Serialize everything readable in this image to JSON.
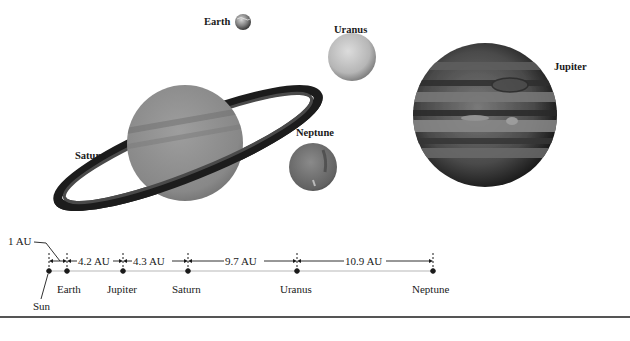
{
  "figure": {
    "planet_labels": {
      "earth": "Earth",
      "uranus": "Uranus",
      "jupiter": "Jupiter",
      "saturn": "Saturn",
      "neptune": "Neptune"
    },
    "scale": {
      "unit_note": "1 AU",
      "segments": [
        {
          "from": "Sun",
          "to": "Earth",
          "label": "1 AU"
        },
        {
          "from": "Earth",
          "to": "Jupiter",
          "label": "4.2 AU"
        },
        {
          "from": "Jupiter",
          "to": "Saturn",
          "label": "4.3 AU"
        },
        {
          "from": "Saturn",
          "to": "Uranus",
          "label": "9.7 AU"
        },
        {
          "from": "Uranus",
          "to": "Neptune",
          "label": "10.9 AU"
        }
      ],
      "bodies": [
        "Sun",
        "Earth",
        "Jupiter",
        "Saturn",
        "Uranus",
        "Neptune"
      ]
    },
    "colors": {
      "ink": "#1a1a1a",
      "rule": "#555555",
      "jupiter_dark": "#2a2a2a",
      "saturn_body": "#8c8c8c",
      "uranus_body": "#bdbdbd",
      "neptune_body": "#6e6e6e"
    }
  }
}
